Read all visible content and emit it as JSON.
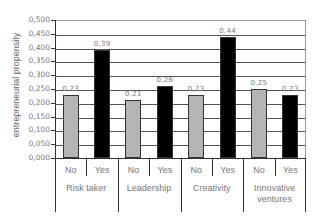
{
  "chart_data": {
    "type": "bar",
    "title": "",
    "xlabel": "",
    "ylabel": "entrepreneurial propensity",
    "ylim": [
      0,
      0.5
    ],
    "yticks": [
      "0,000",
      "0,050",
      "0,100",
      "0,150",
      "0,200",
      "0,250",
      "0,300",
      "0,350",
      "0,400",
      "0,450",
      "0,500"
    ],
    "grid": true,
    "legend": null,
    "categories": [
      "Risk taker",
      "Leadership",
      "Creativity",
      "Innovative ventures"
    ],
    "subcategories": [
      "No",
      "Yes"
    ],
    "series": [
      {
        "name": "No",
        "color": "#b4b4b4",
        "values": [
          0.23,
          0.21,
          0.23,
          0.25
        ],
        "labels": [
          "0,23",
          "0,21",
          "0,23",
          "0,25"
        ]
      },
      {
        "name": "Yes",
        "color": "#000000",
        "values": [
          0.39,
          0.26,
          0.44,
          0.23
        ],
        "labels": [
          "0,39",
          "0,26",
          "0,44",
          "0,23"
        ]
      }
    ]
  },
  "axis": {
    "ylabel": "entrepreneurial propensity",
    "ticks": [
      "0,000",
      "0,050",
      "0,100",
      "0,150",
      "0,200",
      "0,250",
      "0,300",
      "0,350",
      "0,400",
      "0,450",
      "0,500"
    ]
  },
  "groups": [
    {
      "name": "Risk taker",
      "no_label": "No",
      "yes_label": "Yes",
      "no_value": "0,23",
      "yes_value": "0,39"
    },
    {
      "name": "Leadership",
      "no_label": "No",
      "yes_label": "Yes",
      "no_value": "0,21",
      "yes_value": "0,26"
    },
    {
      "name": "Creativity",
      "no_label": "No",
      "yes_label": "Yes",
      "no_value": "0,23",
      "yes_value": "0,44"
    },
    {
      "name": "Innovative ventures",
      "no_label": "No",
      "yes_label": "Yes",
      "no_value": "0,25",
      "yes_value": "0,23"
    }
  ]
}
